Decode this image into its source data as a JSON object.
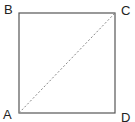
{
  "diagram": {
    "type": "square-with-diagonal",
    "vertices": [
      {
        "label": "A",
        "x": 19,
        "y": 113
      },
      {
        "label": "B",
        "x": 19,
        "y": 13
      },
      {
        "label": "C",
        "x": 115,
        "y": 13
      },
      {
        "label": "D",
        "x": 115,
        "y": 113
      }
    ],
    "diagonal": {
      "from": "A",
      "to": "C",
      "style": "dashed"
    },
    "colors": {
      "stroke": "#555555",
      "diagonal": "#888888"
    }
  }
}
